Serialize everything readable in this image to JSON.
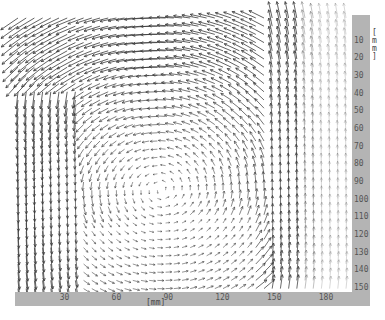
{
  "chart_data": {
    "type": "vector_field",
    "title": "",
    "xlabel": "[mm]",
    "ylabel": "[mm]",
    "x_ticks": [
      30,
      60,
      90,
      120,
      150,
      180
    ],
    "y_ticks": [
      10,
      20,
      30,
      40,
      50,
      60,
      70,
      80,
      90,
      100,
      110,
      120,
      130,
      140,
      150
    ],
    "xlim": [
      0,
      195
    ],
    "ylim": [
      0,
      155
    ],
    "y_axis_position": "right",
    "y_axis_inverted": true,
    "grid": false,
    "flow_description": "Single counter-clockwise recirculating vortex: leftward flow along top, strong downward jet along left wall, weak rightward flow near bottom, upward flow along right side; vortex core near x≈85 mm, y≈95 mm; faint vectors at far right edge.",
    "vortex_center_mm": [
      85,
      95
    ],
    "grid_spacing_mm": 4.5,
    "sample_vectors": [
      {
        "x": 10,
        "y": 10,
        "u": -0.3,
        "v": 0.9
      },
      {
        "x": 60,
        "y": 5,
        "u": -1.0,
        "v": 0.05
      },
      {
        "x": 120,
        "y": 5,
        "u": -1.0,
        "v": 0.0
      },
      {
        "x": 150,
        "y": 10,
        "u": -0.6,
        "v": -0.7
      },
      {
        "x": 10,
        "y": 80,
        "u": 0.0,
        "v": 1.0
      },
      {
        "x": 40,
        "y": 80,
        "u": -0.05,
        "v": 0.5
      },
      {
        "x": 85,
        "y": 95,
        "u": 0.0,
        "v": 0.0
      },
      {
        "x": 90,
        "y": 150,
        "u": 0.3,
        "v": 0.0
      },
      {
        "x": 130,
        "y": 100,
        "u": 0.0,
        "v": -0.4
      },
      {
        "x": 155,
        "y": 100,
        "u": 0.0,
        "v": -0.9
      },
      {
        "x": 175,
        "y": 100,
        "u": 0.0,
        "v": -0.7
      }
    ]
  },
  "labels": {
    "x_unit": "[mm]",
    "y_unit_chars": [
      "[",
      "m",
      "m",
      "]"
    ]
  },
  "colors": {
    "band": "#b4b4b4",
    "arrow": "#3a3a3a",
    "background": "#ffffff"
  }
}
